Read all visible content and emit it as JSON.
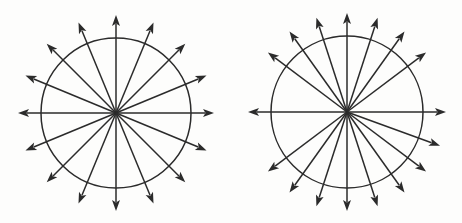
{
  "figure": {
    "background_color": "#fdfdfc",
    "stroke_color": "#2b2b2b",
    "stroke_width": 1.5,
    "width": 462,
    "height": 223
  },
  "chart_data": {
    "type": "scatter",
    "subtitle": "",
    "xlabel": "",
    "ylabel": "",
    "grid": false,
    "legend_position": "none",
    "panels": [
      {
        "name": "left-panel",
        "label": "Uniform radial distribution",
        "center_x": 116,
        "center_y": 113,
        "circle_radius": 75,
        "arrow_radius": 98,
        "ray_count": 16,
        "spacing_degrees": 22.5,
        "distribution": "uniform",
        "angles_degrees": [
          0,
          22.5,
          45,
          67.5,
          90,
          112.5,
          135,
          157.5,
          180,
          202.5,
          225,
          247.5,
          270,
          292.5,
          315,
          337.5
        ]
      },
      {
        "name": "right-panel",
        "label": "Clustered radial distribution",
        "center_x": 347,
        "center_y": 112,
        "circle_radius": 76,
        "arrow_radius": 99,
        "ray_count": 18,
        "spacing_degrees": 17.5,
        "distribution": "clustered-toward-vertical",
        "angles_degrees": [
          0,
          37,
          54.5,
          72,
          90,
          108,
          125.5,
          143,
          180,
          217,
          234.5,
          252,
          270,
          288,
          305.5,
          323,
          340,
          360
        ]
      }
    ]
  }
}
